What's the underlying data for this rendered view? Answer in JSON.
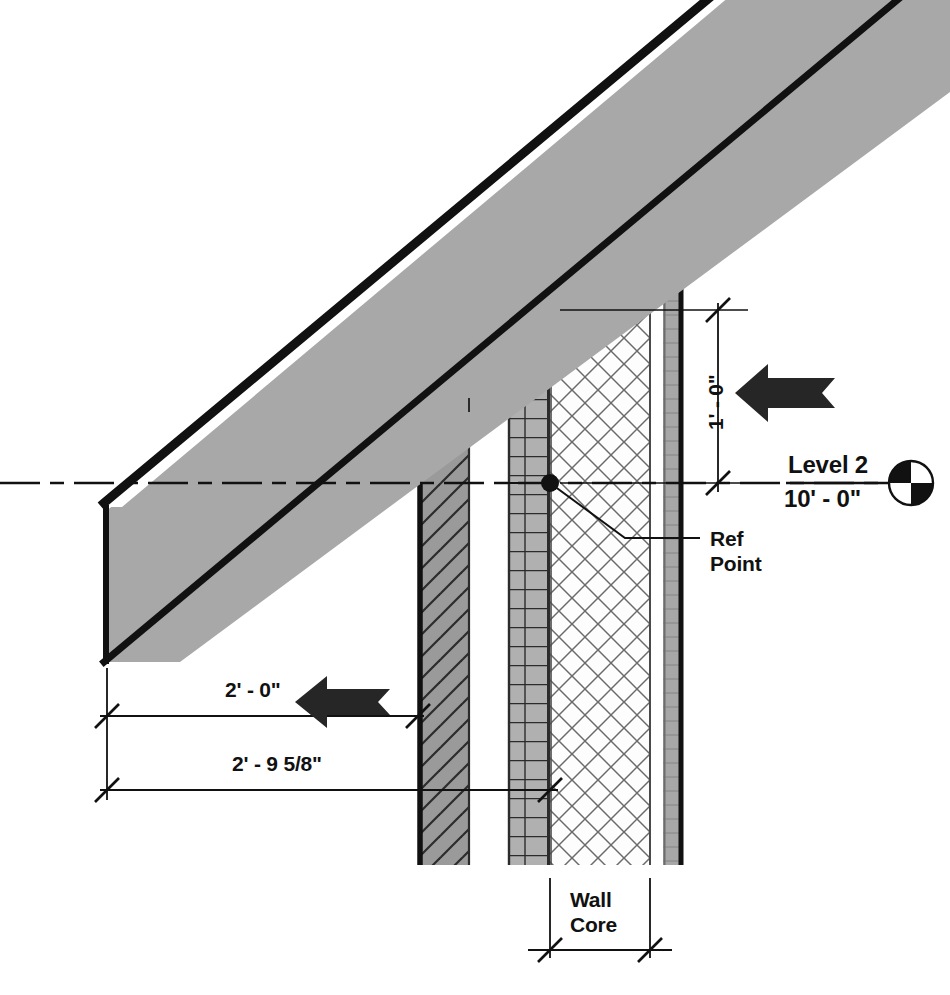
{
  "drawing": {
    "type": "architectural-wall-section-detail",
    "title": "Wall / Roof Junction Section Detail",
    "background_color": "#ffffff",
    "line_color": "#111111",
    "slab_fill_color": "#a8a8a8",
    "masonry_fill_color": "#9a9a9a",
    "brick_fill_color": "#b0b0b0",
    "thin_layer_fill_color": "#a0a0a0",
    "arrow_color": "#262626"
  },
  "dimensions": [
    {
      "id": "vertical-offset",
      "value": "1' - 0\"",
      "orientation": "vertical",
      "axis_x": 718,
      "from_y": 310,
      "to_y": 483,
      "tick_style": "slash"
    },
    {
      "id": "horizontal-face-offset",
      "value": "2' - 0\"",
      "orientation": "horizontal",
      "axis_y": 716,
      "from_x": 107,
      "to_x": 418,
      "tick_style": "slash"
    },
    {
      "id": "horizontal-core-offset",
      "value": "2' - 9 5/8\"",
      "orientation": "horizontal",
      "axis_y": 790,
      "from_x": 107,
      "to_x": 550,
      "tick_style": "slash"
    },
    {
      "id": "wall-core-width",
      "value": "",
      "orientation": "horizontal",
      "axis_y": 950,
      "from_x": 550,
      "to_x": 650,
      "tick_style": "slash"
    }
  ],
  "annotations": [
    {
      "id": "ref-point",
      "text": "Ref\nPoint",
      "line1": "Ref",
      "line2": "Point",
      "text_x": 710,
      "text_y": 528,
      "leader_from": [
        550,
        483
      ],
      "leader_elbow": [
        625,
        538
      ],
      "leader_to": [
        700,
        538
      ]
    },
    {
      "id": "wall-core",
      "text": "Wall\nCore",
      "line1": "Wall",
      "line2": "Core",
      "text_x": 570,
      "text_y": 888
    }
  ],
  "level_marker": {
    "id": "level-2",
    "name": "Level 2",
    "elevation": "10' - 0\"",
    "datum_y": 483,
    "label_x": 788,
    "symbol": "quartered-circle",
    "symbol_cx": 911,
    "symbol_cy": 483,
    "symbol_r": 22,
    "line_style": "dash-dot"
  },
  "arrows": [
    {
      "id": "arrow-vertical-note",
      "direction": "left",
      "x": 735,
      "y": 393,
      "length": 100,
      "height": 58
    },
    {
      "id": "arrow-horizontal-note",
      "direction": "left",
      "x": 295,
      "y": 702,
      "length": 95,
      "height": 52
    }
  ],
  "wall_layers": [
    {
      "id": "exterior-masonry",
      "hatch": "diagonal",
      "x": 418,
      "width": 52,
      "top": 400,
      "bottom": 865
    },
    {
      "id": "air-cavity",
      "hatch": "none",
      "x": 470,
      "width": 38,
      "top": 388,
      "bottom": 865
    },
    {
      "id": "brick-coursing",
      "hatch": "coursed",
      "x": 508,
      "width": 42,
      "top": 337,
      "bottom": 865
    },
    {
      "id": "core-insulation",
      "hatch": "crosshatch",
      "x": 550,
      "width": 100,
      "top": 280,
      "bottom": 865
    },
    {
      "id": "interior-cavity",
      "hatch": "none",
      "x": 650,
      "width": 13,
      "top": 252,
      "bottom": 865
    },
    {
      "id": "interior-finish",
      "hatch": "solid-thin",
      "x": 663,
      "width": 20,
      "top": 222,
      "bottom": 865
    }
  ],
  "roof_slab": {
    "id": "sloped-roof-slab",
    "fill": "#a8a8a8",
    "edge": "#111111",
    "highlight": "#ffffff",
    "left_end_x": 104,
    "left_end_top_y": 513,
    "left_end_bottom_y": 662
  }
}
